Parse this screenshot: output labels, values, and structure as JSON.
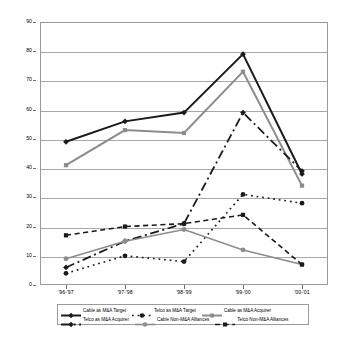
{
  "chart_data": {
    "type": "line",
    "title": "",
    "xlabel": "",
    "ylabel": "",
    "ylim": [
      0,
      90
    ],
    "ytick_step": 10,
    "grid": true,
    "legend_position": "bottom",
    "categories": [
      "'96-'97",
      "'97-'98",
      "'98-'99",
      "'99-'00",
      "'00-'01"
    ],
    "yticks": [
      "0",
      "10",
      "20",
      "30",
      "40",
      "50",
      "60",
      "70",
      "80",
      "90"
    ],
    "series": [
      {
        "name": "Cable as M&A Target",
        "values": [
          49,
          56,
          59,
          79,
          38
        ],
        "color": "#1a1a1a",
        "style": "solid",
        "marker": "diamond",
        "width": 2.0
      },
      {
        "name": "Telco as M&A Target",
        "values": [
          4,
          10,
          8,
          31,
          28
        ],
        "color": "#1a1a1a",
        "style": "dotted",
        "marker": "circle",
        "width": 1.6
      },
      {
        "name": "Cable as M&A Acquirer",
        "values": [
          41,
          53,
          52,
          73,
          34
        ],
        "color": "#8c8c8c",
        "style": "solid",
        "marker": "square",
        "width": 2.0
      },
      {
        "name": "Telco as M&A Acquirer",
        "values": [
          6,
          15,
          21,
          59,
          39
        ],
        "color": "#1a1a1a",
        "style": "dashdot",
        "marker": "diamond",
        "width": 1.8
      },
      {
        "name": "Cable Non-M&A Alliances",
        "values": [
          9,
          15,
          19,
          12,
          7
        ],
        "color": "#8c8c8c",
        "style": "solid",
        "marker": "circle",
        "width": 1.6
      },
      {
        "name": "Telco Non-M&A Alliances",
        "values": [
          17,
          20,
          21,
          24,
          7
        ],
        "color": "#1a1a1a",
        "style": "dashed",
        "marker": "square",
        "width": 1.6
      }
    ]
  },
  "legend": {
    "rows": [
      [
        "Cable as M&A Target",
        "Telco as M&A Target",
        "Cable as M&A Acquirer"
      ],
      [
        "Telco as M&A Acquirer",
        "Cable Non-M&A Alliances",
        "Telco Non-M&A Alliances"
      ]
    ]
  },
  "colors": {
    "dark": "#1a1a1a",
    "gray": "#8c8c8c",
    "grid": "#a8a8a8",
    "frame": "#9a9a9a",
    "background": "#ffffff"
  }
}
